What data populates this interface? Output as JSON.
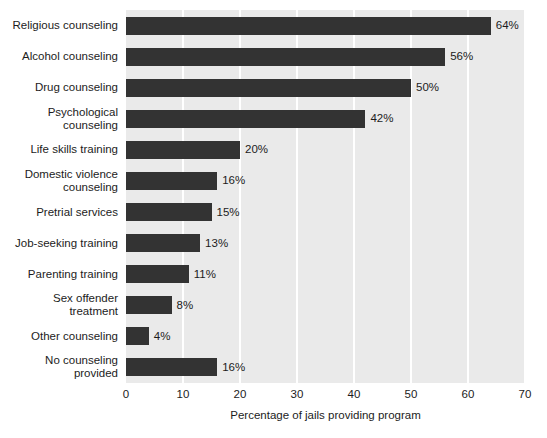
{
  "chart_data": {
    "type": "bar",
    "orientation": "horizontal",
    "title": "",
    "xlabel": "Percentage of jails providing program",
    "ylabel": "",
    "xlim": [
      0,
      70
    ],
    "xticks": [
      0,
      10,
      20,
      30,
      40,
      50,
      60,
      70
    ],
    "xtick_labels": [
      "0",
      "10",
      "20",
      "30",
      "40",
      "50",
      "60",
      "70"
    ],
    "grid": "vertical",
    "legend": "none",
    "categories": [
      "Religious counseling",
      "Alcohol counseling",
      "Drug counseling",
      "Psychological\ncounseling",
      "Life skills training",
      "Domestic violence\ncounseling",
      "Pretrial services",
      "Job-seeking training",
      "Parenting training",
      "Sex offender\ntreatment",
      "Other counseling",
      "No counseling\nprovided"
    ],
    "values": [
      64,
      56,
      50,
      42,
      20,
      16,
      15,
      13,
      11,
      8,
      4,
      16
    ],
    "value_labels": [
      "64%",
      "56%",
      "50%",
      "42%",
      "20%",
      "16%",
      "15%",
      "13%",
      "11%",
      "8%",
      "4%",
      "16%"
    ],
    "colors": {
      "bar": "#333333",
      "plot_background": "#eaeaea",
      "gridline": "#ffffff",
      "text": "#1c1c1c",
      "page_background": "#ffffff"
    }
  }
}
